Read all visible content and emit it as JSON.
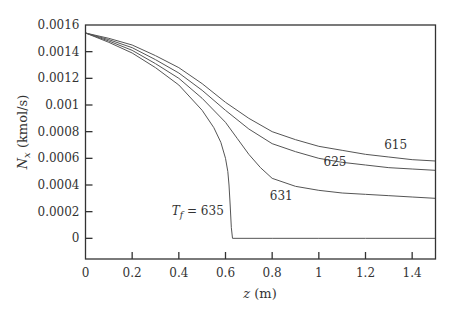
{
  "chart_data": {
    "type": "line",
    "title": "",
    "xlabel": "z (m)",
    "xlabel_var": "z",
    "xlabel_unit": " (m)",
    "ylabel": "N_x (kmol/s)",
    "ylabel_var": "N",
    "ylabel_sub": "x",
    "ylabel_unit": " (kmol/s)",
    "xlim": [
      0,
      1.5
    ],
    "ylim": [
      -0.000155,
      0.0016
    ],
    "grid": false,
    "legend": "inline curve labels",
    "x_ticks": [
      0,
      0.2,
      0.4,
      0.6,
      0.8,
      1.0,
      1.2,
      1.4
    ],
    "x_tick_labels": [
      "0",
      "0.2",
      "0.4",
      "0.6",
      "0.8",
      "1",
      "1.2",
      "1.4"
    ],
    "y_ticks": [
      0,
      0.0002,
      0.0004,
      0.0006,
      0.0008,
      0.001,
      0.0012,
      0.0014,
      0.0016
    ],
    "y_tick_labels": [
      "0",
      "0.0002",
      "0.0004",
      "0.0006",
      "0.0008",
      "0.001",
      "0.0012",
      "0.0014",
      "0.0016"
    ],
    "series": [
      {
        "name": "615",
        "label": "615",
        "label_pos": [
          1.28,
          0.00067
        ],
        "x": [
          0,
          0.1,
          0.2,
          0.3,
          0.4,
          0.5,
          0.6,
          0.7,
          0.8,
          0.9,
          1.0,
          1.1,
          1.2,
          1.3,
          1.4,
          1.5
        ],
        "values": [
          0.00154,
          0.0015,
          0.00145,
          0.00137,
          0.00128,
          0.00116,
          0.00102,
          0.0009,
          0.0008,
          0.00074,
          0.00069,
          0.00066,
          0.00063,
          0.00061,
          0.00059,
          0.00058
        ]
      },
      {
        "name": "625",
        "label": "625",
        "label_pos": [
          1.02,
          0.00054
        ],
        "x": [
          0,
          0.1,
          0.2,
          0.3,
          0.4,
          0.5,
          0.6,
          0.7,
          0.8,
          0.9,
          1.0,
          1.1,
          1.2,
          1.3,
          1.4,
          1.5
        ],
        "values": [
          0.00154,
          0.00149,
          0.00143,
          0.00134,
          0.00124,
          0.00111,
          0.00096,
          0.00082,
          0.00071,
          0.00065,
          0.0006,
          0.00057,
          0.00055,
          0.00053,
          0.00052,
          0.00051
        ]
      },
      {
        "name": "631",
        "label": "631",
        "label_pos": [
          0.79,
          0.00029
        ],
        "x": [
          0,
          0.1,
          0.2,
          0.3,
          0.4,
          0.5,
          0.6,
          0.65,
          0.7,
          0.75,
          0.8,
          0.9,
          1.0,
          1.1,
          1.2,
          1.3,
          1.4,
          1.5
        ],
        "values": [
          0.00154,
          0.00148,
          0.00141,
          0.00131,
          0.0012,
          0.00105,
          0.00087,
          0.00075,
          0.00063,
          0.00053,
          0.00045,
          0.00039,
          0.00036,
          0.00034,
          0.00033,
          0.00032,
          0.00031,
          0.0003
        ]
      },
      {
        "name": "635",
        "label": "T_f = 635",
        "label_var": "T",
        "label_sub": "f",
        "label_rest": " = 635",
        "label_pos": [
          0.37,
          0.000175
        ],
        "x": [
          0,
          0.1,
          0.2,
          0.3,
          0.4,
          0.5,
          0.55,
          0.58,
          0.6,
          0.61,
          0.615,
          0.62,
          0.625,
          0.63,
          0.8,
          1.0,
          1.2,
          1.5
        ],
        "values": [
          0.00154,
          0.00147,
          0.00139,
          0.00128,
          0.00115,
          0.00096,
          0.00083,
          0.00072,
          0.0006,
          0.0005,
          0.0004,
          0.00025,
          8e-05,
          0.0,
          0.0,
          0.0,
          0.0,
          0.0
        ]
      }
    ]
  },
  "colors": {
    "curve": "#555555",
    "axis": "#333333",
    "text": "#333333",
    "background": "#ffffff"
  }
}
